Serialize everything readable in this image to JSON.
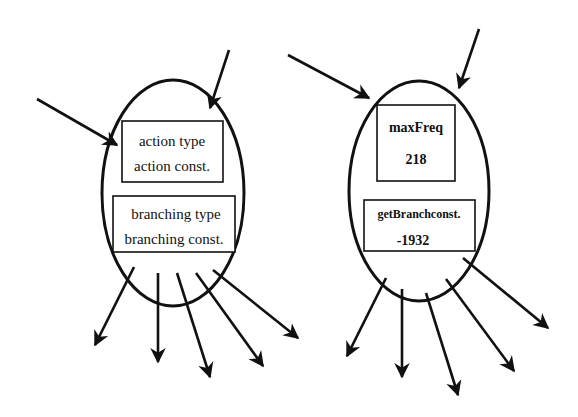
{
  "diagram": {
    "left_node": {
      "top_box": {
        "line1": "action type",
        "line2": "action const."
      },
      "bottom_box": {
        "line1": "branching type",
        "line2": "branching const."
      },
      "incoming_arrows": 2,
      "outgoing_arrows": 5
    },
    "right_node": {
      "top_box": {
        "line1": "maxFreq",
        "line2": "218"
      },
      "bottom_box": {
        "line1": "getBranchconst.",
        "line2": "-1932"
      },
      "incoming_arrows": 2,
      "outgoing_arrows": 5
    },
    "colors": {
      "stroke": "#111111",
      "background": "#ffffff"
    }
  }
}
